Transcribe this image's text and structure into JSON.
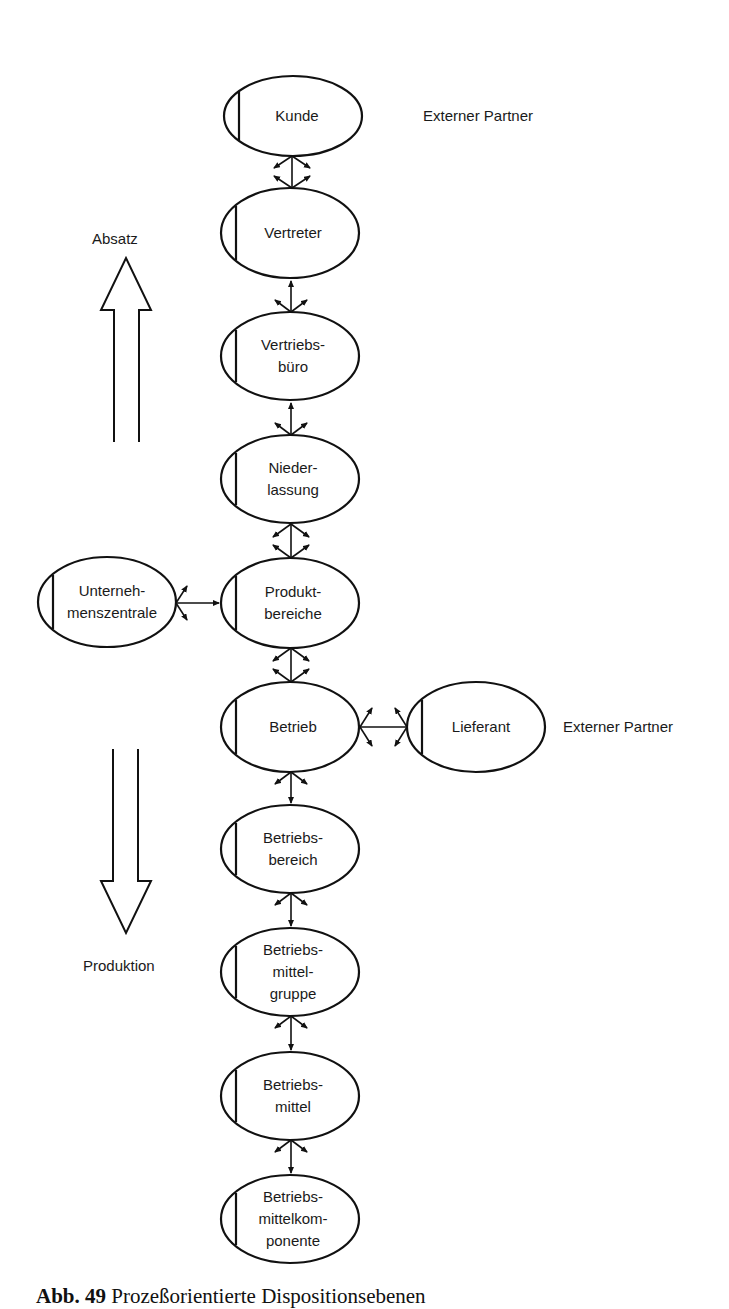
{
  "figure": {
    "caption_number": "Abb. 49",
    "caption_text": "Prozeßorientierte Dispositionsebenen"
  },
  "side_labels": {
    "absatz": "Absatz",
    "produktion": "Produktion",
    "partner_top": "Externer Partner",
    "partner_right": "Externer Partner"
  },
  "nodes": [
    {
      "id": "kunde",
      "label": "Kunde",
      "cx": 293,
      "cy": 116,
      "rx": 69,
      "ry": 40
    },
    {
      "id": "vertreter",
      "label": "Vertreter",
      "cx": 290,
      "cy": 233,
      "rx": 69,
      "ry": 45
    },
    {
      "id": "vertriebsbuero",
      "label": "Vertriebs-\nbüro",
      "cx": 290,
      "cy": 356,
      "rx": 69,
      "ry": 44
    },
    {
      "id": "niederlassung",
      "label": "Nieder-\nlassung",
      "cx": 290,
      "cy": 479,
      "rx": 69,
      "ry": 44
    },
    {
      "id": "produktbereiche",
      "label": "Produkt-\nbereiche",
      "cx": 290,
      "cy": 603,
      "rx": 69,
      "ry": 45
    },
    {
      "id": "unternehmenszentrale",
      "label": "Unterneh-\nmenszentrale",
      "cx": 107,
      "cy": 602,
      "rx": 69,
      "ry": 45
    },
    {
      "id": "betrieb",
      "label": "Betrieb",
      "cx": 290,
      "cy": 727,
      "rx": 69,
      "ry": 45
    },
    {
      "id": "lieferant",
      "label": "Lieferant",
      "cx": 476,
      "cy": 727,
      "rx": 69,
      "ry": 45
    },
    {
      "id": "betriebsbereich",
      "label": "Betriebs-\nbereich",
      "cx": 290,
      "cy": 849,
      "rx": 69,
      "ry": 44
    },
    {
      "id": "betriebsmittelgruppe",
      "label": "Betriebs-\nmittel-\ngruppe",
      "cx": 290,
      "cy": 972,
      "rx": 69,
      "ry": 44
    },
    {
      "id": "betriebsmittel",
      "label": "Betriebs-\nmittel",
      "cx": 290,
      "cy": 1096,
      "rx": 69,
      "ry": 44
    },
    {
      "id": "betriebsmittelkomponente",
      "label": "Betriebs-\nmittelkom-\nponente",
      "cx": 290,
      "cy": 1219,
      "rx": 69,
      "ry": 44
    }
  ],
  "edges": [
    {
      "from": "kunde",
      "to": "vertreter",
      "style": "fork-both"
    },
    {
      "from": "vertreter",
      "to": "vertriebsbuero",
      "style": "fork-down"
    },
    {
      "from": "vertriebsbuero",
      "to": "niederlassung",
      "style": "fork-down"
    },
    {
      "from": "niederlassung",
      "to": "produktbereiche",
      "style": "fork-both"
    },
    {
      "from": "unternehmenszentrale",
      "to": "produktbereiche",
      "style": "fork-left"
    },
    {
      "from": "produktbereiche",
      "to": "betrieb",
      "style": "fork-both"
    },
    {
      "from": "betrieb",
      "to": "lieferant",
      "style": "fork-both-horizontal"
    },
    {
      "from": "betrieb",
      "to": "betriebsbereich",
      "style": "fork-up"
    },
    {
      "from": "betriebsbereich",
      "to": "betriebsmittelgruppe",
      "style": "fork-up"
    },
    {
      "from": "betriebsmittelgruppe",
      "to": "betriebsmittel",
      "style": "fork-up"
    },
    {
      "from": "betriebsmittel",
      "to": "betriebsmittelkomponente",
      "style": "fork-up"
    }
  ],
  "colors": {
    "stroke": "#111111",
    "text": "#1a1a1a",
    "background": "#ffffff"
  }
}
